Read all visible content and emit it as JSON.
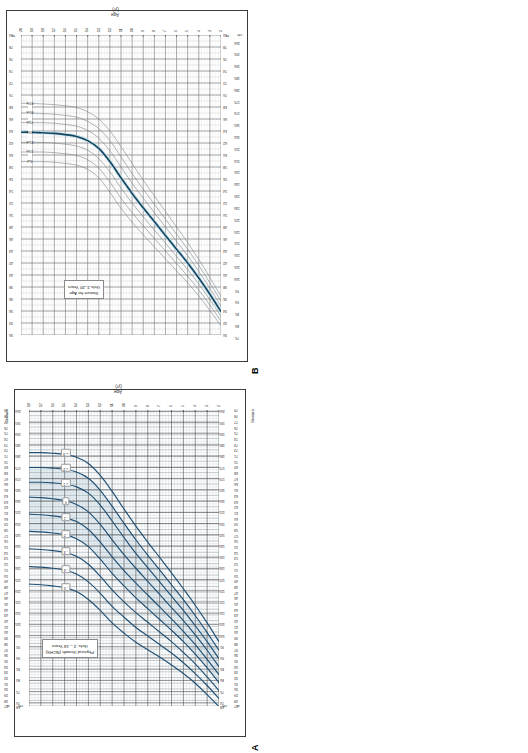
{
  "figure": {
    "panels": [
      {
        "letter": "A",
        "title_line1": "Physical Growth (NCHS)",
        "title_line2": "Girls:  2 – 18 Years",
        "x_axis_label": "Age (yr)",
        "y_axis_label_left": "Stature",
        "y_axis_label_right": "Stature",
        "curve_color": "#1f4f74",
        "band_color": "#cfe0ea"
      },
      {
        "letter": "B",
        "title_line1": "Stature for Age",
        "title_line2": "Girls 2–20 Years",
        "x_axis_label": "Age (yr)",
        "y_axis_label_left": "",
        "curve_color": "#12455f",
        "median_color": "#16475f",
        "percentile_color": "#6f7c85"
      }
    ]
  },
  "chart_data": [
    {
      "id": "panel-b",
      "type": "line",
      "title": "Stature for Age  /  Girls 2–20 Years",
      "xlabel": "Age (yr)",
      "ylabel": "Stature",
      "x_unit": "yr",
      "y_unit_primary": "in",
      "y_unit_secondary": "cm",
      "xlim": [
        2,
        20
      ],
      "ylim_in": [
        30,
        80
      ],
      "ylim_cm": [
        76,
        203
      ],
      "grid": true,
      "legend_position": "inline-right-of-curves",
      "xticks": [
        2,
        3,
        4,
        5,
        6,
        7,
        8,
        9,
        10,
        11,
        12,
        13,
        14,
        15,
        16,
        17,
        18,
        19,
        20
      ],
      "yticks_in": [
        30,
        32,
        34,
        36,
        38,
        40,
        42,
        44,
        46,
        48,
        50,
        52,
        54,
        56,
        58,
        60,
        62,
        64,
        66,
        68,
        70,
        72,
        74,
        76,
        78,
        80
      ],
      "yticks_cm": [
        75,
        80,
        85,
        90,
        95,
        100,
        105,
        110,
        115,
        120,
        125,
        130,
        135,
        140,
        145,
        150,
        155,
        160,
        165,
        170,
        175,
        180,
        185,
        190,
        195,
        200
      ],
      "y_unit_tick_label": "in",
      "y_unit_tick_label_cm": "cm",
      "x": [
        2,
        3,
        4,
        5,
        6,
        7,
        8,
        9,
        10,
        11,
        12,
        13,
        14,
        15,
        16,
        17,
        18,
        19,
        20
      ],
      "series": [
        {
          "name": "97th",
          "label": "97th",
          "emphasis": "thin",
          "values": [
            36.4,
            39.6,
            42.6,
            45.4,
            48.0,
            50.6,
            53.2,
            55.8,
            58.6,
            61.4,
            64.0,
            66.0,
            67.2,
            67.9,
            68.2,
            68.4,
            68.5,
            68.6,
            68.6
          ]
        },
        {
          "name": "90th",
          "label": "90th",
          "emphasis": "thin",
          "values": [
            35.6,
            38.7,
            41.6,
            44.3,
            46.8,
            49.3,
            51.8,
            54.3,
            56.9,
            59.7,
            62.4,
            64.4,
            65.6,
            66.3,
            66.6,
            66.8,
            66.9,
            67.0,
            67.0
          ]
        },
        {
          "name": "75th",
          "label": "75th",
          "emphasis": "thin",
          "values": [
            34.8,
            37.8,
            40.6,
            43.2,
            45.6,
            48.0,
            50.4,
            52.8,
            55.3,
            58.0,
            60.7,
            62.8,
            64.1,
            64.8,
            65.1,
            65.3,
            65.4,
            65.4,
            65.4
          ]
        },
        {
          "name": "50th",
          "label": "50th",
          "emphasis": "thick",
          "values": [
            33.9,
            36.8,
            39.5,
            42.0,
            44.3,
            46.6,
            48.9,
            51.2,
            53.6,
            56.2,
            58.9,
            61.1,
            62.4,
            63.1,
            63.4,
            63.6,
            63.7,
            63.8,
            63.8
          ]
        },
        {
          "name": "25th",
          "label": "25th",
          "emphasis": "thin",
          "values": [
            33.1,
            35.9,
            38.5,
            40.9,
            43.1,
            45.3,
            47.5,
            49.7,
            52.0,
            54.5,
            57.2,
            59.4,
            60.8,
            61.5,
            61.8,
            62.0,
            62.1,
            62.1,
            62.1
          ]
        },
        {
          "name": "10th",
          "label": "10th",
          "emphasis": "thin",
          "values": [
            32.3,
            35.0,
            37.5,
            39.8,
            41.9,
            44.0,
            46.1,
            48.2,
            50.4,
            52.8,
            55.5,
            57.8,
            59.2,
            59.9,
            60.2,
            60.4,
            60.5,
            60.5,
            60.5
          ]
        },
        {
          "name": "3rd",
          "label": "3rd",
          "emphasis": "thin",
          "values": [
            31.5,
            34.1,
            36.5,
            38.7,
            40.7,
            42.7,
            44.7,
            46.7,
            48.8,
            51.1,
            53.8,
            56.2,
            57.6,
            58.3,
            58.6,
            58.8,
            58.9,
            58.9,
            58.9
          ]
        }
      ],
      "annotations": [
        "97th",
        "90th",
        "75th",
        "50th",
        "25th",
        "10th",
        "3rd"
      ]
    },
    {
      "id": "panel-a",
      "type": "line",
      "title": "Physical Growth (NCHS)  /  Girls:  2 – 18 Years",
      "xlabel": "Age (yr)",
      "ylabel": "Stature",
      "x_unit": "yr",
      "y_unit_primary": "in",
      "y_unit_secondary": "cm",
      "xlim": [
        2,
        18
      ],
      "ylim_in": [
        27,
        79
      ],
      "ylim_cm": [
        68,
        201
      ],
      "grid": true,
      "legend_position": "chips-on-curve-ends",
      "xticks": [
        2,
        3,
        4,
        5,
        6,
        7,
        8,
        9,
        10,
        11,
        12,
        13,
        14,
        15,
        16,
        17,
        18
      ],
      "yticks_in": [
        27,
        28,
        29,
        30,
        31,
        32,
        33,
        34,
        35,
        36,
        37,
        38,
        39,
        40,
        41,
        42,
        43,
        44,
        45,
        46,
        47,
        48,
        49,
        50,
        51,
        52,
        53,
        54,
        55,
        56,
        57,
        58,
        59,
        60,
        61,
        62,
        63,
        64,
        65,
        66,
        67,
        68,
        69,
        70,
        71,
        72,
        73,
        74,
        75,
        76,
        77,
        78,
        79
      ],
      "yticks_cm": [
        68,
        70,
        75,
        80,
        85,
        90,
        95,
        100,
        105,
        110,
        115,
        120,
        125,
        130,
        135,
        140,
        145,
        150,
        155,
        160,
        165,
        170,
        175,
        180,
        185,
        190,
        195,
        200
      ],
      "y_unit_tick_label": "in",
      "y_unit_tick_label_cm": "cm",
      "x": [
        2,
        3,
        4,
        5,
        6,
        7,
        8,
        9,
        10,
        11,
        12,
        13,
        14,
        15,
        16,
        17,
        18
      ],
      "series": [
        {
          "name": "+3 SD",
          "label": "+ 3",
          "values": [
            38.3,
            41.6,
            44.7,
            47.6,
            50.4,
            53.1,
            55.8,
            58.6,
            61.6,
            64.7,
            67.5,
            69.6,
            70.7,
            71.2,
            71.4,
            71.5,
            71.5
          ]
        },
        {
          "name": "+2 SD",
          "label": "+ 2",
          "values": [
            36.8,
            39.9,
            42.9,
            45.7,
            48.3,
            50.9,
            53.5,
            56.2,
            59.1,
            62.1,
            64.9,
            67.0,
            68.1,
            68.6,
            68.8,
            68.9,
            68.9
          ]
        },
        {
          "name": "+1 SD",
          "label": "+ 1",
          "values": [
            35.3,
            38.3,
            41.1,
            43.8,
            46.3,
            48.8,
            51.3,
            53.8,
            56.6,
            59.5,
            62.3,
            64.4,
            65.5,
            66.0,
            66.2,
            66.3,
            66.3
          ]
        },
        {
          "name": "0 SD",
          "label": "0",
          "values": [
            33.9,
            36.8,
            39.5,
            42.0,
            44.3,
            46.6,
            48.9,
            51.2,
            53.6,
            56.2,
            58.9,
            61.1,
            62.4,
            63.1,
            63.4,
            63.6,
            63.7
          ]
        },
        {
          "name": "-1 SD",
          "label": "- 1",
          "values": [
            32.5,
            35.2,
            37.8,
            40.1,
            42.3,
            44.4,
            46.5,
            48.6,
            50.8,
            53.2,
            55.8,
            58.0,
            59.4,
            60.1,
            60.4,
            60.6,
            60.7
          ]
        },
        {
          "name": "-2 SD",
          "label": "- 2",
          "values": [
            31.1,
            33.7,
            36.1,
            38.3,
            40.3,
            42.2,
            44.1,
            46.0,
            48.1,
            50.3,
            52.8,
            55.0,
            56.4,
            57.1,
            57.4,
            57.6,
            57.7
          ]
        },
        {
          "name": "-3 SD",
          "label": "- 3",
          "values": [
            29.7,
            32.1,
            34.4,
            36.4,
            38.3,
            40.0,
            41.7,
            43.4,
            45.3,
            47.4,
            49.8,
            51.9,
            53.3,
            54.0,
            54.3,
            54.5,
            54.6
          ]
        },
        {
          "name": "-4 SD",
          "label": "- 4",
          "values": [
            28.3,
            30.6,
            32.7,
            34.6,
            36.3,
            37.8,
            39.3,
            40.8,
            42.6,
            44.5,
            46.8,
            48.8,
            50.2,
            50.9,
            51.2,
            51.4,
            51.5
          ]
        },
        {
          "name": "-5 SD",
          "label": "- 5",
          "values": [
            26.9,
            29.0,
            31.0,
            32.7,
            34.2,
            35.6,
            36.9,
            38.2,
            39.8,
            41.6,
            43.8,
            45.7,
            47.1,
            47.8,
            48.1,
            48.3,
            48.4
          ]
        }
      ],
      "annotations": [
        "+ 3",
        "+ 2",
        "+ 1",
        "0",
        "- 1",
        "- 2",
        "- 3",
        "- 4",
        "- 5"
      ]
    }
  ]
}
